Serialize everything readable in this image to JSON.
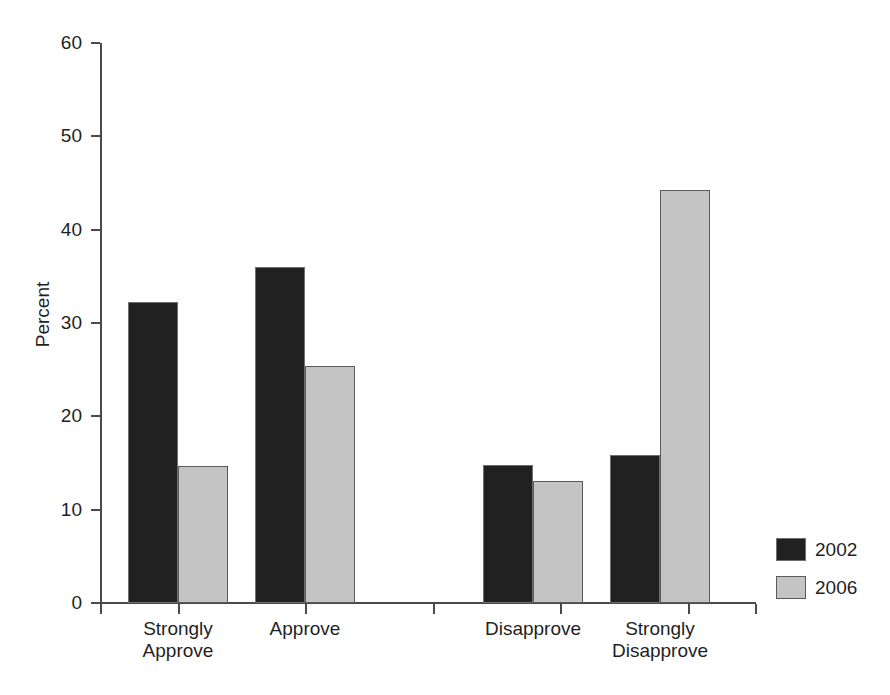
{
  "chart_data": {
    "type": "bar",
    "title": "",
    "xlabel": "",
    "ylabel": "Percent",
    "categories": [
      "Strongly\nApprove",
      "Approve",
      "Disapprove",
      "Strongly\nDisapprove"
    ],
    "series": [
      {
        "name": "2002",
        "color": "#212121",
        "values": [
          32.2,
          36.0,
          14.8,
          15.9
        ]
      },
      {
        "name": "2006",
        "color": "#c4c4c4",
        "values": [
          14.7,
          25.4,
          13.1,
          44.3
        ]
      }
    ],
    "ylim": [
      0,
      60
    ],
    "ytick_values": [
      0,
      10,
      20,
      30,
      40,
      50,
      60
    ],
    "ytick_labels": [
      "0",
      "10",
      "20",
      "30",
      "40",
      "50",
      "60"
    ],
    "grid": false,
    "legend_position": "right"
  },
  "legend": {
    "entries": [
      {
        "label": "2002",
        "swatch": "dark-swatch"
      },
      {
        "label": "2006",
        "swatch": "light-swatch"
      }
    ]
  },
  "axes": {
    "y_title": "Percent"
  }
}
